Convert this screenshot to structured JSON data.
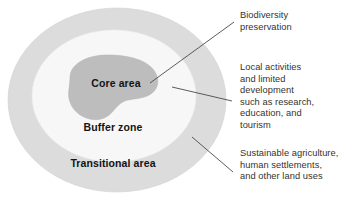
{
  "diagram": {
    "zones": [
      {
        "id": "transitional",
        "label": "Transitional area",
        "color": "#dcdcdc",
        "order": 1
      },
      {
        "id": "buffer",
        "label": "Buffer zone",
        "color": "#f7f7f7",
        "order": 2
      },
      {
        "id": "core",
        "label": "Core area",
        "color": "#bdbdbd",
        "order": 3
      }
    ],
    "callouts": [
      {
        "id": "biodiversity",
        "text": "Biodiversity\npreservation",
        "points_to": "core"
      },
      {
        "id": "local",
        "text": "Local activities\nand limited\ndevelopment\nsuch as research,\neducation, and\ntourism",
        "points_to": "buffer"
      },
      {
        "id": "sustainable",
        "text": "Sustainable agriculture,\nhuman settlements,\nand other land uses",
        "points_to": "transitional"
      }
    ],
    "leader_line_color": "#4a4a4a",
    "background_color": "#ffffff",
    "text_color": "#333333",
    "label_color": "#141414"
  }
}
